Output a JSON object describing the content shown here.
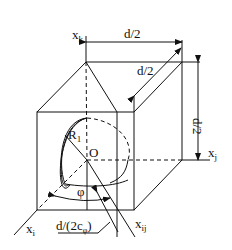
{
  "diagram": {
    "type": "geometry",
    "labels": {
      "axis_k": "x",
      "axis_k_sub": "k",
      "axis_j": "x",
      "axis_j_sub": "j",
      "axis_i": "x",
      "axis_i_sub": "i",
      "axis_ij": "x",
      "axis_ij_sub": "ij",
      "dim_top": "d/2",
      "dim_diag": "d/2",
      "dim_right": "d/2",
      "radius": "R",
      "radius_sub": "1",
      "origin": "O",
      "angle": "φ",
      "dim_bottom_main": "d/(2c",
      "dim_bottom_sub": "φ",
      "dim_bottom_close": ")"
    },
    "colors": {
      "stroke": "#111111",
      "background": "#ffffff"
    }
  }
}
